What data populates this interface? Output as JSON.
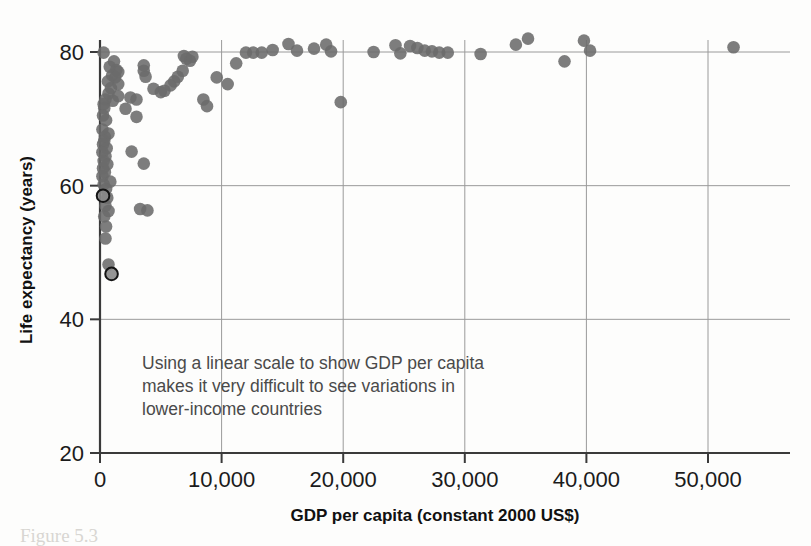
{
  "figure": {
    "background": "#fdfdfc",
    "point_color": "#6b6b6b",
    "highlight_outline": "#141414",
    "grid_color": "#9a9a9a",
    "axis_color": "#3a3a3a",
    "annotation_color": "#4a4a4a"
  },
  "axes": {
    "x_title": "GDP per capita (constant 2000 US$)",
    "y_title": "Life expectancy (years)",
    "x_ticks": [
      "0",
      "10,000",
      "20,000",
      "30,000",
      "40,000",
      "50,000"
    ],
    "y_ticks": [
      "20",
      "40",
      "60",
      "80"
    ]
  },
  "annotation": {
    "line1": "Using a linear scale to show GDP per capita",
    "line2": "makes it very difficult to see variations in",
    "line3": "lower-income countries"
  },
  "caption": {
    "ghost_text": "Figure 5.3"
  },
  "chart_data": {
    "type": "scatter",
    "title": "",
    "xlabel": "GDP per capita (constant 2000 US$)",
    "ylabel": "Life expectancy (years)",
    "xlim": [
      0,
      58000
    ],
    "ylim": [
      20,
      84
    ],
    "xticks": [
      0,
      10000,
      20000,
      30000,
      40000,
      50000
    ],
    "yticks": [
      20,
      40,
      60,
      80
    ],
    "grid": true,
    "legend": "none",
    "marker": "circle",
    "marker_color": "#6b6b6b",
    "marker_opacity": 0.88,
    "highlighted_points": [
      {
        "x": 250,
        "y": 58.5
      },
      {
        "x": 950,
        "y": 46.8
      }
    ],
    "points": [
      {
        "x": 300,
        "y": 79.9
      },
      {
        "x": 1150,
        "y": 78.6
      },
      {
        "x": 800,
        "y": 77.8
      },
      {
        "x": 1350,
        "y": 77.3
      },
      {
        "x": 1500,
        "y": 77.0
      },
      {
        "x": 1000,
        "y": 76.5
      },
      {
        "x": 1250,
        "y": 76.2
      },
      {
        "x": 650,
        "y": 75.6
      },
      {
        "x": 1500,
        "y": 75.2
      },
      {
        "x": 900,
        "y": 74.6
      },
      {
        "x": 700,
        "y": 73.8
      },
      {
        "x": 1500,
        "y": 73.4
      },
      {
        "x": 450,
        "y": 72.9
      },
      {
        "x": 1050,
        "y": 72.7
      },
      {
        "x": 300,
        "y": 72.2
      },
      {
        "x": 350,
        "y": 71.6
      },
      {
        "x": 250,
        "y": 70.5
      },
      {
        "x": 500,
        "y": 69.8
      },
      {
        "x": 200,
        "y": 68.4
      },
      {
        "x": 700,
        "y": 67.8
      },
      {
        "x": 400,
        "y": 67.3
      },
      {
        "x": 350,
        "y": 66.7
      },
      {
        "x": 250,
        "y": 66.2
      },
      {
        "x": 550,
        "y": 65.6
      },
      {
        "x": 200,
        "y": 65.0
      },
      {
        "x": 450,
        "y": 64.4
      },
      {
        "x": 300,
        "y": 63.7
      },
      {
        "x": 600,
        "y": 63.2
      },
      {
        "x": 250,
        "y": 62.6
      },
      {
        "x": 400,
        "y": 62.0
      },
      {
        "x": 200,
        "y": 61.4
      },
      {
        "x": 850,
        "y": 60.6
      },
      {
        "x": 300,
        "y": 60.2
      },
      {
        "x": 500,
        "y": 59.5
      },
      {
        "x": 600,
        "y": 58.2
      },
      {
        "x": 450,
        "y": 57.0
      },
      {
        "x": 700,
        "y": 56.2
      },
      {
        "x": 350,
        "y": 55.4
      },
      {
        "x": 500,
        "y": 53.9
      },
      {
        "x": 450,
        "y": 52.1
      },
      {
        "x": 700,
        "y": 48.2
      },
      {
        "x": 2100,
        "y": 71.5
      },
      {
        "x": 3000,
        "y": 70.3
      },
      {
        "x": 2600,
        "y": 65.1
      },
      {
        "x": 3600,
        "y": 63.3
      },
      {
        "x": 3300,
        "y": 56.5
      },
      {
        "x": 3900,
        "y": 56.3
      },
      {
        "x": 2500,
        "y": 73.2
      },
      {
        "x": 3000,
        "y": 72.9
      },
      {
        "x": 3600,
        "y": 77.2
      },
      {
        "x": 3750,
        "y": 76.3
      },
      {
        "x": 3600,
        "y": 78.0
      },
      {
        "x": 4400,
        "y": 74.5
      },
      {
        "x": 5000,
        "y": 74.0
      },
      {
        "x": 5300,
        "y": 74.2
      },
      {
        "x": 5800,
        "y": 75.0
      },
      {
        "x": 6100,
        "y": 75.6
      },
      {
        "x": 6400,
        "y": 76.3
      },
      {
        "x": 6800,
        "y": 77.2
      },
      {
        "x": 6900,
        "y": 79.4
      },
      {
        "x": 7100,
        "y": 79.0
      },
      {
        "x": 7400,
        "y": 78.7
      },
      {
        "x": 7600,
        "y": 79.3
      },
      {
        "x": 8500,
        "y": 72.9
      },
      {
        "x": 8800,
        "y": 71.9
      },
      {
        "x": 9600,
        "y": 76.2
      },
      {
        "x": 10500,
        "y": 75.2
      },
      {
        "x": 11200,
        "y": 78.3
      },
      {
        "x": 12000,
        "y": 79.9
      },
      {
        "x": 12600,
        "y": 79.9
      },
      {
        "x": 13300,
        "y": 79.9
      },
      {
        "x": 14200,
        "y": 80.3
      },
      {
        "x": 15500,
        "y": 81.2
      },
      {
        "x": 16200,
        "y": 80.2
      },
      {
        "x": 17600,
        "y": 80.5
      },
      {
        "x": 18600,
        "y": 81.1
      },
      {
        "x": 19000,
        "y": 80.1
      },
      {
        "x": 19800,
        "y": 72.5
      },
      {
        "x": 22500,
        "y": 80.0
      },
      {
        "x": 24300,
        "y": 81.0
      },
      {
        "x": 24700,
        "y": 79.8
      },
      {
        "x": 25500,
        "y": 80.9
      },
      {
        "x": 26100,
        "y": 80.6
      },
      {
        "x": 26700,
        "y": 80.2
      },
      {
        "x": 27300,
        "y": 80.1
      },
      {
        "x": 27900,
        "y": 79.9
      },
      {
        "x": 28600,
        "y": 79.9
      },
      {
        "x": 31300,
        "y": 79.7
      },
      {
        "x": 34200,
        "y": 81.1
      },
      {
        "x": 35200,
        "y": 82.0
      },
      {
        "x": 38200,
        "y": 78.6
      },
      {
        "x": 39800,
        "y": 81.7
      },
      {
        "x": 40300,
        "y": 80.2
      },
      {
        "x": 52100,
        "y": 80.7
      }
    ]
  }
}
